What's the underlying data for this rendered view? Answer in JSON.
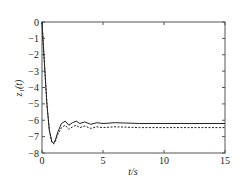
{
  "chart_data": {
    "type": "line",
    "title": "",
    "xlabel": "t/s",
    "ylabel": "z₁(t)",
    "xlim": [
      0,
      15
    ],
    "ylim": [
      -8,
      0
    ],
    "xticks": [
      0,
      5,
      10,
      15
    ],
    "yticks": [
      0,
      -1,
      -2,
      -3,
      -4,
      -5,
      -6,
      -7,
      -8
    ],
    "grid": false,
    "legend": null,
    "series": [
      {
        "name": "solid",
        "style": "solid",
        "x": [
          0,
          0.2,
          0.4,
          0.6,
          0.8,
          0.95,
          1.1,
          1.3,
          1.6,
          1.9,
          2.2,
          2.5,
          2.8,
          3.1,
          3.5,
          4.0,
          4.5,
          5.0,
          6.0,
          8.0,
          10.0,
          15.0
        ],
        "y": [
          0,
          -2.5,
          -5.0,
          -6.6,
          -7.3,
          -7.4,
          -7.2,
          -6.7,
          -6.2,
          -6.05,
          -6.3,
          -6.15,
          -6.05,
          -6.2,
          -6.1,
          -6.25,
          -6.15,
          -6.2,
          -6.15,
          -6.2,
          -6.2,
          -6.2
        ]
      },
      {
        "name": "dashed",
        "style": "dashed",
        "x": [
          0,
          0.2,
          0.4,
          0.6,
          0.8,
          0.95,
          1.1,
          1.3,
          1.6,
          1.9,
          2.2,
          2.5,
          2.8,
          3.1,
          3.5,
          4.0,
          4.5,
          5.0,
          6.0,
          8.0,
          10.0,
          15.0
        ],
        "y": [
          0,
          -2.5,
          -5.0,
          -6.6,
          -7.35,
          -7.45,
          -7.3,
          -6.85,
          -6.45,
          -6.3,
          -6.55,
          -6.4,
          -6.3,
          -6.45,
          -6.35,
          -6.5,
          -6.4,
          -6.45,
          -6.4,
          -6.45,
          -6.45,
          -6.45
        ]
      }
    ]
  },
  "labels": {
    "xlabel": "t/s",
    "ylabel": "z₁(t)",
    "xticks": [
      "0",
      "5",
      "10",
      "15"
    ],
    "yticks": [
      "0",
      "−1",
      "−2",
      "−3",
      "−4",
      "−5",
      "−6",
      "−7",
      "−8"
    ]
  },
  "colors": {
    "axis": "#555555",
    "line": "#222222"
  }
}
